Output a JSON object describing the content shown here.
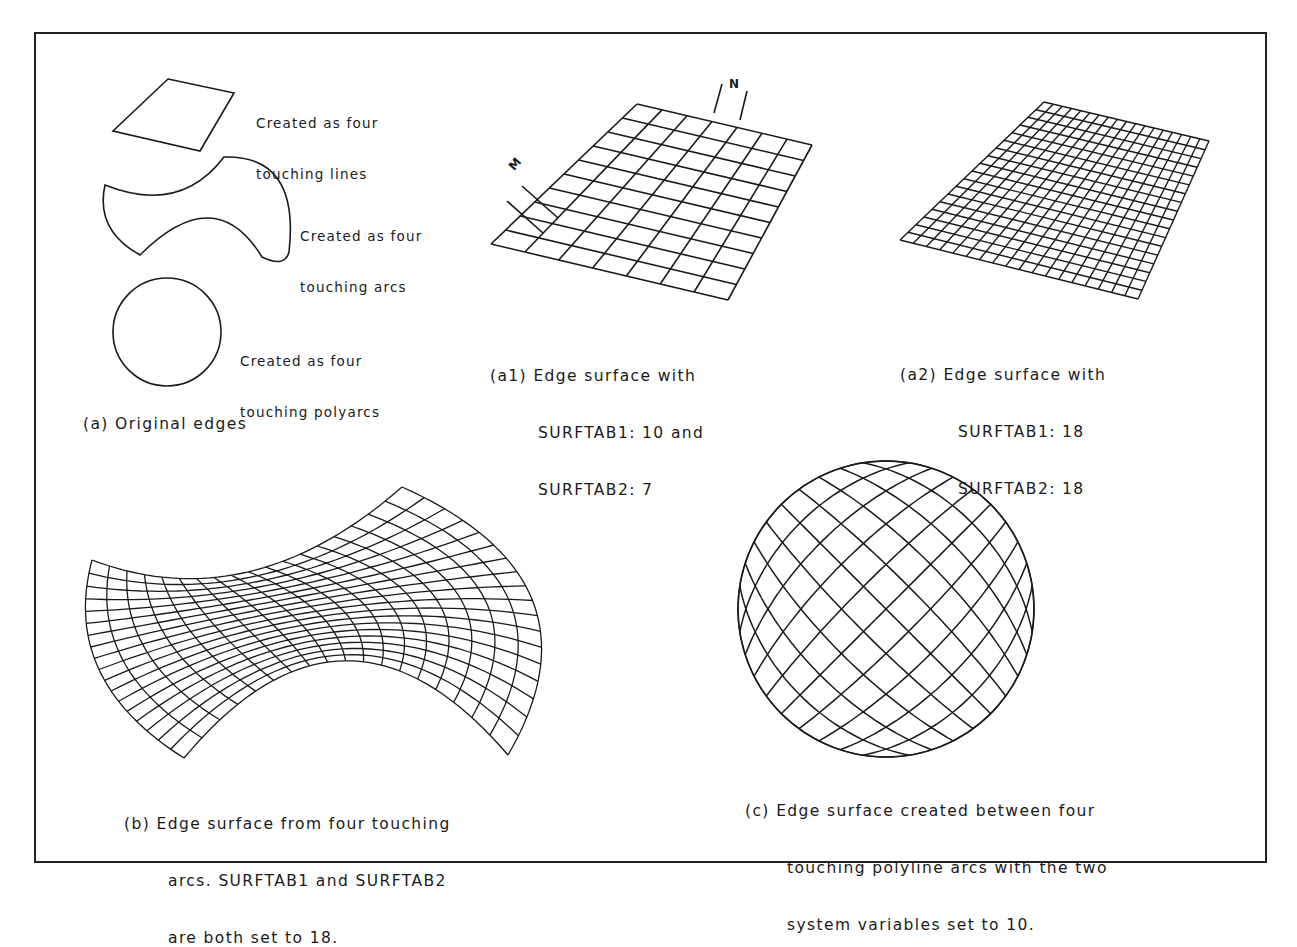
{
  "figure": {
    "frame_color": "#222222",
    "line_color": "#1a1a1a"
  },
  "panel_a": {
    "caption": "(a) Original edges",
    "items": [
      {
        "shape": "four-lines",
        "label_line1": "Created as four",
        "label_line2": "touching lines"
      },
      {
        "shape": "four-arcs",
        "label_line1": "Created as four",
        "label_line2": "touching arcs"
      },
      {
        "shape": "four-polyarcs",
        "label_line1": "Created as four",
        "label_line2": "touching polyarcs"
      }
    ]
  },
  "panel_a1": {
    "caption_prefix": "(a1)",
    "caption_line1": "Edge surface with",
    "caption_line2": "SURFTAB1: 10 and",
    "caption_line3": "SURFTAB2: 7",
    "surftab1": 10,
    "surftab2": 7,
    "marker_m": "M",
    "marker_n": "N",
    "corners": {
      "tl": [
        637,
        104
      ],
      "tr": [
        812,
        145
      ],
      "br": [
        728,
        300
      ],
      "bl": [
        491,
        244
      ]
    }
  },
  "panel_a2": {
    "caption_prefix": "(a2)",
    "caption_line1": "Edge surface with",
    "caption_line2": "SURFTAB1: 18",
    "caption_line3": "SURFTAB2: 18",
    "surftab1": 18,
    "surftab2": 18,
    "corners": {
      "tl": [
        1044,
        102
      ],
      "tr": [
        1209,
        141
      ],
      "br": [
        1138,
        299
      ],
      "bl": [
        900,
        240
      ]
    }
  },
  "panel_b": {
    "caption_line1": "(b) Edge surface from four touching",
    "caption_line2": "arcs. SURFTAB1 and SURFTAB2",
    "caption_line3": "are both set to 18.",
    "surftab1": 18,
    "surftab2": 18
  },
  "panel_c": {
    "caption_line1": "(c) Edge surface created between four",
    "caption_line2": "touching polyline arcs with the two",
    "caption_line3": "system variables set to 10.",
    "surftab1": 10,
    "surftab2": 10,
    "center": [
      886,
      609
    ],
    "radius": 148
  }
}
